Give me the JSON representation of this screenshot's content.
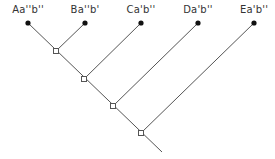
{
  "diagram": {
    "type": "cladogram",
    "taxa": [
      {
        "id": "A",
        "label": "Aa''b''",
        "x": 28
      },
      {
        "id": "B",
        "label": "Ba''b'",
        "x": 85
      },
      {
        "id": "C",
        "label": "Ca'b''",
        "x": 141
      },
      {
        "id": "D",
        "label": "Da'b''",
        "x": 198
      },
      {
        "id": "E",
        "label": "Ea'b''",
        "x": 254
      }
    ],
    "colors": {
      "line": "#555555",
      "leaf": "#111111",
      "node_fill": "#ffffff",
      "node_stroke": "#555555",
      "text": "#333333"
    }
  }
}
